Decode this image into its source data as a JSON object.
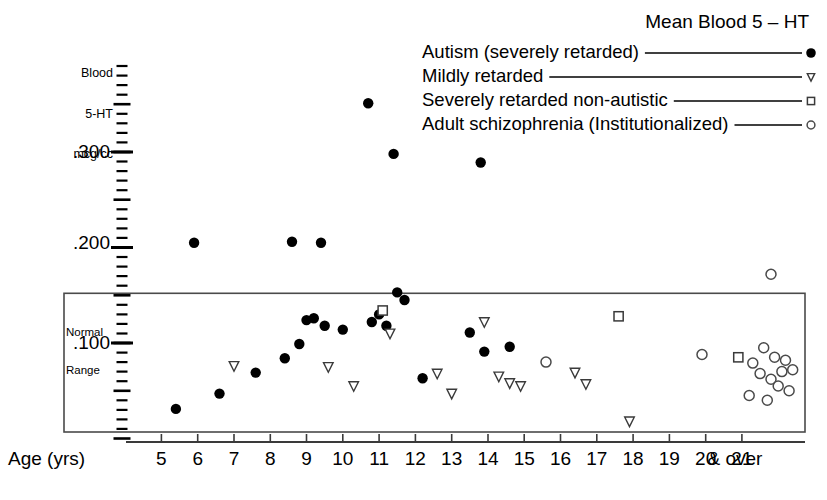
{
  "chart_data": {
    "type": "scatter",
    "title": "Mean Blood 5 – HT",
    "xlabel": "Age (yrs)",
    "ylabel": "Blood 5-HT mcg/cc",
    "ylabel_lines": [
      "Blood",
      "5-HT",
      "mcg/cc"
    ],
    "xlim": [
      4.3,
      22.6
    ],
    "ylim": [
      0.0,
      0.395
    ],
    "ytick_labels": [
      ".300",
      ".200",
      ".100"
    ],
    "ytick_values": [
      0.3,
      0.2,
      0.1
    ],
    "xtick_labels": [
      "5",
      "6",
      "7",
      "8",
      "9",
      "10",
      "11",
      "12",
      "13",
      "14",
      "15",
      "16",
      "17",
      "18",
      "19",
      "20",
      "21"
    ],
    "xtick_values": [
      5,
      6,
      7,
      8,
      9,
      10,
      11,
      12,
      13,
      14,
      15,
      16,
      17,
      18,
      19,
      20,
      21
    ],
    "x_extra_label": "& over",
    "grid": false,
    "legend_position": "top-right",
    "annotations": [
      {
        "text": "Normal Range",
        "lines": [
          "Normal",
          "Range"
        ],
        "type": "box-label"
      }
    ],
    "normal_range_box": {
      "y_low": 0.0,
      "y_high": 0.152,
      "x_low": 4.4,
      "x_high": 22.5
    },
    "series": [
      {
        "name": "Autism (severely retarded)",
        "marker": "filled-circle",
        "color": "#000000",
        "points": [
          [
            5.4,
            0.031
          ],
          [
            5.9,
            0.205
          ],
          [
            6.6,
            0.047
          ],
          [
            7.6,
            0.069
          ],
          [
            8.4,
            0.084
          ],
          [
            8.6,
            0.206
          ],
          [
            8.8,
            0.099
          ],
          [
            9.0,
            0.124
          ],
          [
            9.2,
            0.126
          ],
          [
            9.4,
            0.205
          ],
          [
            9.5,
            0.118
          ],
          [
            10.0,
            0.114
          ],
          [
            10.7,
            0.351
          ],
          [
            10.8,
            0.122
          ],
          [
            11.0,
            0.13
          ],
          [
            11.2,
            0.118
          ],
          [
            11.5,
            0.153
          ],
          [
            11.7,
            0.145
          ],
          [
            11.4,
            0.298
          ],
          [
            12.2,
            0.063
          ],
          [
            13.5,
            0.111
          ],
          [
            13.8,
            0.289
          ],
          [
            13.9,
            0.091
          ],
          [
            14.6,
            0.096
          ]
        ]
      },
      {
        "name": "Mildly retarded",
        "marker": "open-triangle-down",
        "color": "#000000",
        "points": [
          [
            7.0,
            0.076
          ],
          [
            9.6,
            0.075
          ],
          [
            10.3,
            0.055
          ],
          [
            11.3,
            0.11
          ],
          [
            12.6,
            0.068
          ],
          [
            13.0,
            0.047
          ],
          [
            13.9,
            0.122
          ],
          [
            14.3,
            0.065
          ],
          [
            14.6,
            0.058
          ],
          [
            16.4,
            0.069
          ],
          [
            16.7,
            0.057
          ],
          [
            17.9,
            0.018
          ],
          [
            14.9,
            0.055
          ]
        ]
      },
      {
        "name": "Severely retarded non-autistic",
        "marker": "open-square",
        "color": "#000000",
        "points": [
          [
            11.1,
            0.134
          ],
          [
            17.6,
            0.128
          ],
          [
            20.9,
            0.085
          ]
        ]
      },
      {
        "name": "Adult schizophrenia (Institutionalized)",
        "marker": "open-circle",
        "color": "#000000",
        "points": [
          [
            15.6,
            0.08
          ],
          [
            19.9,
            0.088
          ],
          [
            21.8,
            0.172
          ],
          [
            21.3,
            0.079
          ],
          [
            21.6,
            0.095
          ],
          [
            21.9,
            0.085
          ],
          [
            22.2,
            0.082
          ],
          [
            22.1,
            0.07
          ],
          [
            22.4,
            0.072
          ],
          [
            21.5,
            0.068
          ],
          [
            21.8,
            0.062
          ],
          [
            22.0,
            0.055
          ],
          [
            21.2,
            0.045
          ],
          [
            21.7,
            0.04
          ],
          [
            22.3,
            0.05
          ]
        ]
      }
    ]
  },
  "legend": {
    "title": "Mean Blood 5 – HT",
    "entries": [
      {
        "label": "Autism (severely retarded)",
        "marker": "filled-circle"
      },
      {
        "label": "Mildly retarded",
        "marker": "open-triangle-down"
      },
      {
        "label": "Severely retarded non-autistic",
        "marker": "open-square"
      },
      {
        "label": "Adult schizophrenia (Institutionalized)",
        "marker": "open-circle"
      }
    ]
  },
  "axes": {
    "y_caption": {
      "line1": "Blood",
      "line2": "5-HT",
      "line3": "mcg/cc"
    },
    "x_title": "Age (yrs)",
    "x_over": "& over",
    "y_labels": [
      ".300",
      ".200",
      ".100"
    ],
    "x_labels": [
      "5",
      "6",
      "7",
      "8",
      "9",
      "10",
      "11",
      "12",
      "13",
      "14",
      "15",
      "16",
      "17",
      "18",
      "19",
      "20",
      "21"
    ]
  },
  "normal_range": {
    "line1": "Normal",
    "line2": "Range"
  },
  "colors": {
    "ink": "#000000",
    "axis": "#3a3a3a",
    "box": "#4a4a4a"
  }
}
